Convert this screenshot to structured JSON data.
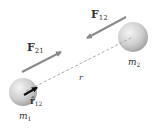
{
  "diagram": {
    "type": "physics-two-body-force",
    "labels": {
      "force_21_main": "F",
      "force_21_sub": "21",
      "force_12_main": "F",
      "force_12_sub": "12",
      "distance": "r",
      "mass_1_main": "m",
      "mass_1_sub": "1",
      "mass_2_main": "m",
      "mass_2_sub": "2",
      "unit_vector_main": "r̂",
      "unit_vector_sub": "12"
    },
    "colors": {
      "sphere": "#c8c8c8",
      "force_arrow": "#8a8a8a",
      "unit_vector_arrow": "#111111",
      "dashed_line": "#9a9a9a",
      "text": "#333333"
    }
  }
}
